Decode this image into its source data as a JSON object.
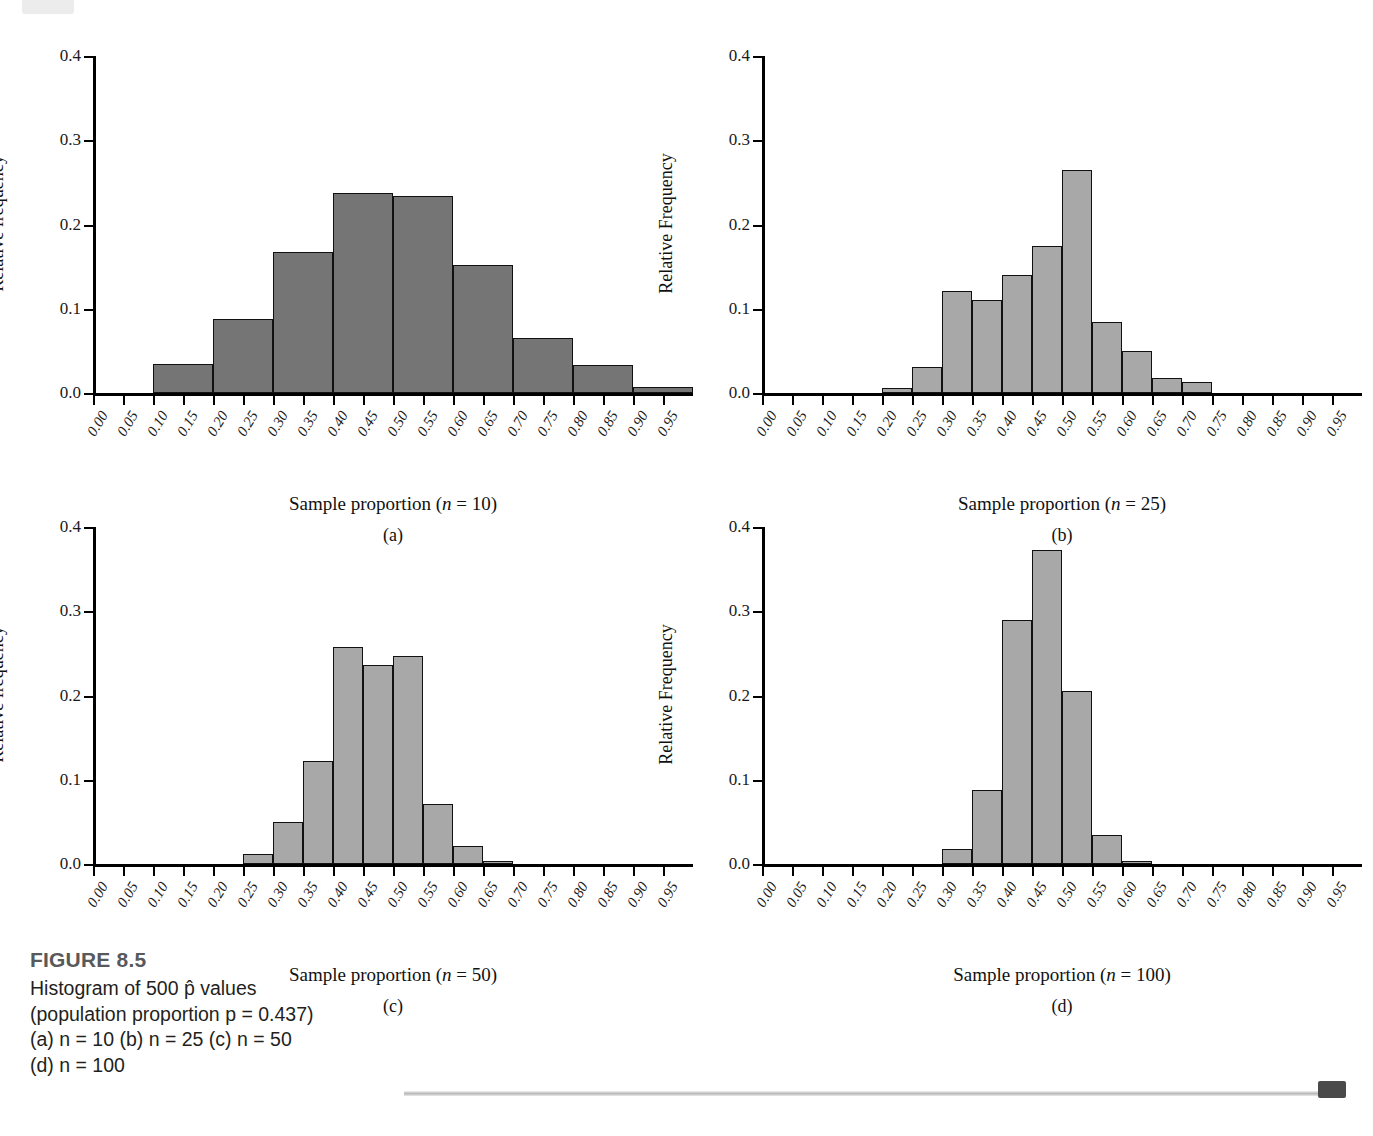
{
  "figure": {
    "number_label": "FIGURE 8.5",
    "caption_lines": [
      "Histogram of 500 p̂ values",
      "(population proportion p = 0.437)",
      "(a) n = 10 (b) n = 25 (c) n = 50",
      "(d) n = 100"
    ]
  },
  "colors": {
    "bar_fill_dark": "#757575",
    "bar_fill_light": "#a8a8a8",
    "bar_stroke": "#111111",
    "axis": "#000000",
    "caption_title": "#58595b",
    "caption_text": "#231f20"
  },
  "axis": {
    "y_ticks": [
      "0.0",
      "0.1",
      "0.2",
      "0.3",
      "0.4"
    ],
    "y_values": [
      0.0,
      0.1,
      0.2,
      0.3,
      0.4
    ],
    "x_ticks": [
      "0.00",
      "0.05",
      "0.10",
      "0.15",
      "0.20",
      "0.25",
      "0.30",
      "0.35",
      "0.40",
      "0.45",
      "0.50",
      "0.55",
      "0.60",
      "0.65",
      "0.70",
      "0.75",
      "0.80",
      "0.85",
      "0.90",
      "0.95"
    ],
    "x_values": [
      0.0,
      0.05,
      0.1,
      0.15,
      0.2,
      0.25,
      0.3,
      0.35,
      0.4,
      0.45,
      0.5,
      0.55,
      0.6,
      0.65,
      0.7,
      0.75,
      0.8,
      0.85,
      0.9,
      0.95
    ],
    "ylim": [
      0.0,
      0.4
    ],
    "xlim": [
      0.0,
      1.0
    ]
  },
  "chart_data": [
    {
      "type": "bar",
      "panel": "a",
      "panel_letter": "(a)",
      "title": "",
      "xlabel": "Sample proportion (n = 10)",
      "xlabel_prefix": "Sample proportion (",
      "xlabel_var": "n",
      "xlabel_suffix": " = 10)",
      "ylabel": "Relative frequency",
      "n": 10,
      "fill": "#757575",
      "bin_width": 0.1,
      "bin_starts": [
        0.0,
        0.1,
        0.2,
        0.3,
        0.4,
        0.5,
        0.6,
        0.7,
        0.8,
        0.9
      ],
      "categories": [
        "0.0-0.1",
        "0.1-0.2",
        "0.2-0.3",
        "0.3-0.4",
        "0.4-0.5",
        "0.5-0.6",
        "0.6-0.7",
        "0.7-0.8",
        "0.8-0.9",
        "0.9-1.0"
      ],
      "values": [
        0.0,
        0.035,
        0.088,
        0.167,
        0.237,
        0.234,
        0.152,
        0.065,
        0.033,
        0.007
      ],
      "ylim": [
        0.0,
        0.4
      ],
      "grid": false,
      "legend": "none"
    },
    {
      "type": "bar",
      "panel": "b",
      "panel_letter": "(b)",
      "title": "",
      "xlabel": "Sample proportion (n = 25)",
      "xlabel_prefix": "Sample proportion (",
      "xlabel_var": "n",
      "xlabel_suffix": " = 25)",
      "ylabel": "Relative Frequency",
      "n": 25,
      "fill": "#a8a8a8",
      "bin_width": 0.05,
      "bin_starts": [
        0.2,
        0.25,
        0.3,
        0.35,
        0.4,
        0.45,
        0.5,
        0.55,
        0.6,
        0.65,
        0.7
      ],
      "categories": [
        "0.20-0.25",
        "0.25-0.30",
        "0.30-0.35",
        "0.35-0.40",
        "0.40-0.45",
        "0.45-0.50",
        "0.50-0.55",
        "0.55-0.60",
        "0.60-0.65",
        "0.65-0.70",
        "0.70-0.75"
      ],
      "values": [
        0.006,
        0.031,
        0.121,
        0.11,
        0.14,
        0.175,
        0.265,
        0.084,
        0.05,
        0.018,
        0.013
      ],
      "ylim": [
        0.0,
        0.4
      ],
      "grid": false,
      "legend": "none"
    },
    {
      "type": "bar",
      "panel": "c",
      "panel_letter": "(c)",
      "title": "",
      "xlabel": "Sample proportion (n = 50)",
      "xlabel_prefix": "Sample proportion (",
      "xlabel_var": "n",
      "xlabel_suffix": " = 50)",
      "ylabel": "Relative frequency",
      "n": 50,
      "fill": "#a8a8a8",
      "bin_width": 0.05,
      "bin_starts": [
        0.25,
        0.3,
        0.35,
        0.4,
        0.45,
        0.5,
        0.55,
        0.6,
        0.65
      ],
      "categories": [
        "0.25-0.30",
        "0.30-0.35",
        "0.35-0.40",
        "0.40-0.45",
        "0.45-0.50",
        "0.50-0.55",
        "0.55-0.60",
        "0.60-0.65",
        "0.65-0.70"
      ],
      "values": [
        0.012,
        0.05,
        0.122,
        0.258,
        0.236,
        0.247,
        0.071,
        0.021,
        0.003
      ],
      "ylim": [
        0.0,
        0.4
      ],
      "grid": false,
      "legend": "none"
    },
    {
      "type": "bar",
      "panel": "d",
      "panel_letter": "(d)",
      "title": "",
      "xlabel": "Sample proportion (n = 100)",
      "xlabel_prefix": "Sample proportion (",
      "xlabel_var": "n",
      "xlabel_suffix": " = 100)",
      "ylabel": "Relative Frequency",
      "n": 100,
      "fill": "#a8a8a8",
      "bin_width": 0.05,
      "bin_starts": [
        0.3,
        0.35,
        0.4,
        0.45,
        0.5,
        0.55,
        0.6
      ],
      "categories": [
        "0.30-0.35",
        "0.35-0.40",
        "0.40-0.45",
        "0.45-0.50",
        "0.50-0.55",
        "0.55-0.60",
        "0.60-0.65"
      ],
      "values": [
        0.018,
        0.088,
        0.29,
        0.373,
        0.205,
        0.034,
        0.004
      ],
      "ylim": [
        0.0,
        0.4
      ],
      "grid": false,
      "legend": "none"
    }
  ]
}
